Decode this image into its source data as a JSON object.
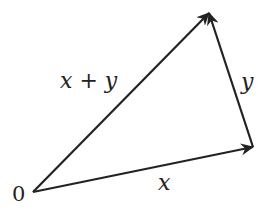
{
  "diagram": {
    "type": "vector-addition",
    "stroke_color": "#222222",
    "background": "#ffffff",
    "points": {
      "origin": {
        "label": "0",
        "x": 33,
        "y": 192
      },
      "x_tip": {
        "x": 253,
        "y": 147
      },
      "sum_tip": {
        "x": 209,
        "y": 13
      }
    },
    "vectors": [
      {
        "id": "x",
        "label": "x",
        "from": "origin",
        "to": "x_tip"
      },
      {
        "id": "y",
        "label": "y",
        "from": "x_tip",
        "to": "sum_tip"
      },
      {
        "id": "x_plus_y",
        "label": "x + y",
        "from": "origin",
        "to": "sum_tip"
      }
    ],
    "labels": {
      "origin": "0",
      "x": "x",
      "y": "y",
      "x_plus_y": "x + y"
    }
  }
}
